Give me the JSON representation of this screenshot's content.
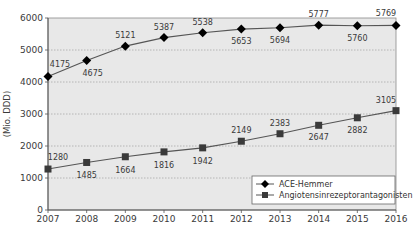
{
  "chart_data": {
    "type": "line",
    "title": "",
    "xlabel": "",
    "ylabel": "(Mio. DDD)",
    "x": [
      2007,
      2008,
      2009,
      2010,
      2011,
      2012,
      2013,
      2014,
      2015,
      2016
    ],
    "ylim": [
      0,
      6000
    ],
    "yticks": [
      0,
      1000,
      2000,
      3000,
      4000,
      5000,
      6000
    ],
    "grid": true,
    "legend_position": "lower right",
    "series": [
      {
        "name": "ACE-Hemmer",
        "marker": "diamond",
        "values": [
          4175,
          4675,
          5121,
          5387,
          5538,
          5653,
          5694,
          5777,
          5760,
          5769
        ]
      },
      {
        "name": "Angiotensinrezeptorantagonisten",
        "marker": "square",
        "values": [
          1280,
          1485,
          1664,
          1816,
          1942,
          2149,
          2383,
          2647,
          2882,
          3105
        ]
      }
    ]
  },
  "colors": {
    "plot_background": "#e8e8e8",
    "gridline": "#a8a8a8",
    "line": "#555555",
    "marker_ace": "#000000",
    "marker_arb": "#3a3a3a"
  }
}
